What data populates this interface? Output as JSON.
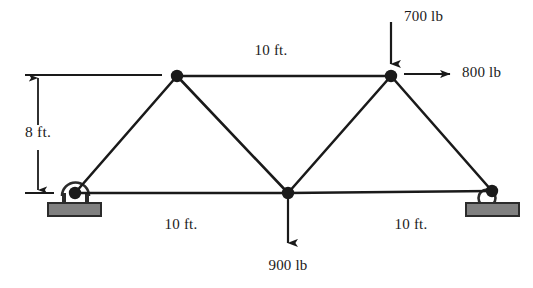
{
  "figure": {
    "kind": "truss-free-body-diagram",
    "colors": {
      "line": "#1a1a1a",
      "node": "#1a1a1a",
      "support_fill": "#808080",
      "support_stroke": "#2b2b2b",
      "background": "#ffffff",
      "text": "#1a1a1a"
    }
  },
  "dimensions": {
    "top_chord_span": "10 ft.",
    "bottom_left_span": "10 ft.",
    "bottom_right_span": "10 ft.",
    "height": "8 ft."
  },
  "loads": {
    "top_vertical": {
      "label": "700 lb",
      "direction": "down",
      "magnitude": 700,
      "unit": "lb"
    },
    "top_horizontal": {
      "label": "800 lb",
      "direction": "right",
      "magnitude": 800,
      "unit": "lb"
    },
    "bottom_vertical": {
      "label": "900 lb",
      "direction": "down",
      "magnitude": 900,
      "unit": "lb"
    }
  },
  "supports": {
    "left": {
      "type": "pin-support",
      "name": "pin-support"
    },
    "right": {
      "type": "roller-support",
      "name": "roller-support"
    }
  },
  "nodes": [
    {
      "id": "A",
      "name": "left-bottom-node",
      "x": 75,
      "y": 193
    },
    {
      "id": "B",
      "name": "left-top-node",
      "x": 177,
      "y": 76
    },
    {
      "id": "C",
      "name": "center-bottom-node",
      "x": 288,
      "y": 193
    },
    {
      "id": "D",
      "name": "right-top-node",
      "x": 391,
      "y": 76
    },
    {
      "id": "E",
      "name": "right-bottom-node",
      "x": 492,
      "y": 191
    }
  ],
  "members": [
    {
      "name": "member-A-B",
      "from": "A",
      "to": "B"
    },
    {
      "name": "member-B-C",
      "from": "B",
      "to": "C"
    },
    {
      "name": "member-B-D",
      "from": "B",
      "to": "D"
    },
    {
      "name": "member-C-D",
      "from": "C",
      "to": "D"
    },
    {
      "name": "member-D-E",
      "from": "D",
      "to": "E"
    },
    {
      "name": "member-A-C",
      "from": "A",
      "to": "C"
    },
    {
      "name": "member-C-E",
      "from": "C",
      "to": "E"
    }
  ]
}
